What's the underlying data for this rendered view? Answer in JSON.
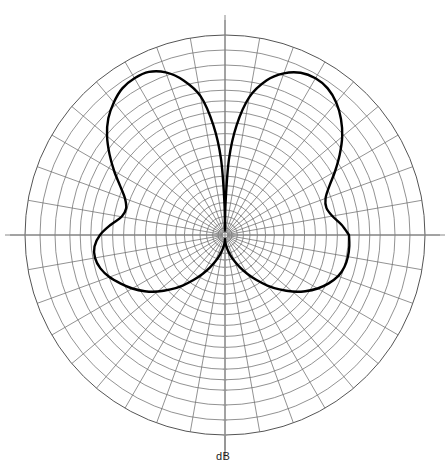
{
  "figure": {
    "kind": "polar-radiation-pattern",
    "background_color": "#ffffff",
    "curve_color": "#000000",
    "grid_color": "#6e6e6e",
    "axis_color": "#8a8a8a"
  },
  "labels": {
    "db_axis": "dB"
  },
  "chart_data": {
    "type": "line",
    "coordinate_system": "polar",
    "title": "",
    "subtitle": "",
    "xlabel": "",
    "ylabel": "dB",
    "radial_axis_label": "dB",
    "angular_axis_label": "",
    "grid": true,
    "legend": null,
    "legend_position": "none",
    "center_px": {
      "x": 225,
      "y": 235
    },
    "outer_radius_px": 200,
    "angular_tick_step_deg": 10,
    "angular_ticks_deg": [
      0,
      10,
      20,
      30,
      40,
      50,
      60,
      70,
      80,
      90,
      100,
      110,
      120,
      130,
      140,
      150,
      160,
      170,
      180,
      190,
      200,
      210,
      220,
      230,
      240,
      250,
      260,
      270,
      280,
      290,
      300,
      310,
      320,
      330,
      340,
      350
    ],
    "major_spokes_deg": [
      0,
      45,
      90,
      135,
      180,
      225,
      270,
      315
    ],
    "radial_rings_count": 20,
    "radial_scale": "logarithmic-dB",
    "rlim_db": [
      -40,
      0
    ],
    "ring_radii_fraction": [
      0.035,
      0.062,
      0.092,
      0.125,
      0.162,
      0.203,
      0.247,
      0.295,
      0.345,
      0.398,
      0.452,
      0.507,
      0.562,
      0.617,
      0.671,
      0.724,
      0.776,
      0.85,
      0.925,
      1.0
    ],
    "series": [
      {
        "name": "radiation pattern",
        "color": "#000000",
        "closed": true,
        "theta_deg": [
          0,
          5,
          10,
          15,
          20,
          25,
          30,
          35,
          40,
          45,
          50,
          55,
          60,
          65,
          70,
          75,
          80,
          84,
          87,
          89,
          90,
          91,
          93,
          96,
          100,
          105,
          110,
          115,
          120,
          125,
          130,
          135,
          140,
          145,
          150,
          155,
          160,
          165,
          170,
          175,
          180,
          185,
          190,
          195,
          200,
          205,
          210,
          215,
          220,
          225,
          230,
          235,
          240,
          245,
          250,
          255,
          260,
          265,
          268,
          270,
          272,
          275,
          280,
          285,
          290,
          295,
          300,
          305,
          310,
          315,
          320,
          325,
          330,
          335,
          340,
          345,
          350,
          355,
          360
        ],
        "r_fraction": [
          0.62,
          0.585,
          0.545,
          0.525,
          0.535,
          0.575,
          0.635,
          0.7,
          0.765,
          0.82,
          0.865,
          0.895,
          0.905,
          0.895,
          0.86,
          0.8,
          0.7,
          0.55,
          0.38,
          0.16,
          0.02,
          0.16,
          0.38,
          0.55,
          0.705,
          0.8,
          0.865,
          0.9,
          0.905,
          0.895,
          0.865,
          0.825,
          0.77,
          0.705,
          0.64,
          0.578,
          0.532,
          0.512,
          0.525,
          0.575,
          0.625,
          0.655,
          0.66,
          0.645,
          0.615,
          0.575,
          0.535,
          0.49,
          0.44,
          0.385,
          0.33,
          0.275,
          0.225,
          0.18,
          0.14,
          0.105,
          0.075,
          0.05,
          0.035,
          0.02,
          0.035,
          0.05,
          0.075,
          0.105,
          0.14,
          0.18,
          0.225,
          0.275,
          0.33,
          0.385,
          0.44,
          0.49,
          0.535,
          0.572,
          0.602,
          0.618,
          0.624,
          0.624,
          0.62
        ],
        "peaks": [
          {
            "theta_deg": 60,
            "r_fraction": 0.905
          },
          {
            "theta_deg": 120,
            "r_fraction": 0.905
          }
        ],
        "nulls": [
          {
            "theta_deg": 90,
            "r_fraction": 0.02
          },
          {
            "theta_deg": 270,
            "r_fraction": 0.02
          }
        ],
        "notches": [
          {
            "theta_deg": 15,
            "r_fraction": 0.525
          },
          {
            "theta_deg": 165,
            "r_fraction": 0.512
          }
        ]
      }
    ]
  }
}
